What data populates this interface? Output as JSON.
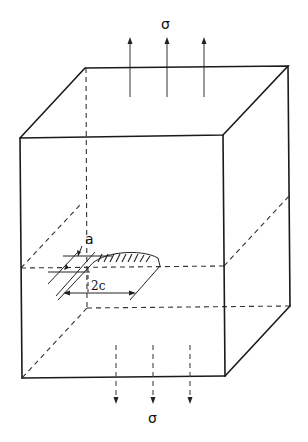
{
  "figure": {
    "labels": {
      "stress_top": "σ",
      "stress_bottom": "σ",
      "crack_depth": "a",
      "crack_length": "2c"
    },
    "stress_arrows": {
      "top_count": 3,
      "top_direction": "up",
      "bottom_count": 3,
      "bottom_direction": "down"
    },
    "colors": {
      "line": "#1a1a1a",
      "background": "#ffffff"
    }
  }
}
